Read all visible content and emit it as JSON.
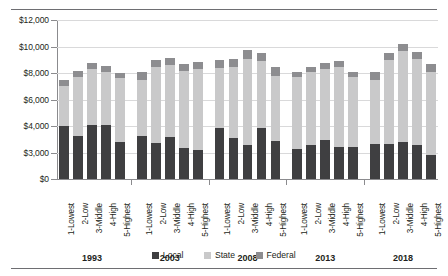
{
  "chart_data": {
    "type": "bar",
    "subtype": "stacked-bar-grouped",
    "title": "",
    "xlabel": "",
    "ylabel": "",
    "grid": true,
    "legend_position": "bottom-center",
    "y_axis": {
      "tick_labels": [
        "$0",
        "$3,000",
        "$4,000",
        "$6,000",
        "$8,000",
        "$10,000",
        "$12,000"
      ],
      "tick_values": [
        0,
        3000,
        4000,
        6000,
        8000,
        10000,
        12000
      ],
      "broken_axis": true,
      "note": "ticks evenly spaced in pixels despite unequal value steps",
      "ylim": [
        0,
        12000
      ]
    },
    "groups": [
      "1993",
      "2003",
      "2008",
      "2013",
      "2018"
    ],
    "categories": [
      "1-Lowest",
      "2-Low",
      "3-Middle",
      "4-High",
      "5-Highest"
    ],
    "series": [
      {
        "name": "Local",
        "color": "#3f3f41",
        "values": [
          [
            4000,
            3620,
            4050,
            4040,
            3400
          ],
          [
            3620,
            3370,
            3570,
            3170,
            3110
          ],
          [
            3940,
            3550,
            3290,
            3920,
            3420
          ],
          [
            3120,
            3290,
            3460,
            3220,
            3220
          ],
          [
            3310,
            3310,
            3380,
            3290,
            2700
          ]
        ]
      },
      {
        "name": "State",
        "color": "#c9c9ca",
        "values": [
          [
            3020,
            4070,
            4250,
            4060,
            4200
          ],
          [
            3870,
            5060,
            5030,
            4960,
            5180
          ],
          [
            4470,
            4900,
            5790,
            4960,
            4380
          ],
          [
            4600,
            4760,
            4860,
            5230,
            4480
          ],
          [
            4180,
            5670,
            6250,
            5760,
            5400
          ]
        ]
      },
      {
        "name": "Federal",
        "color": "#8d8d90",
        "values": [
          [
            480,
            440,
            460,
            440,
            430
          ],
          [
            580,
            520,
            530,
            560,
            540
          ],
          [
            610,
            640,
            660,
            640,
            620
          ],
          [
            370,
            400,
            430,
            420,
            400
          ],
          [
            580,
            540,
            570,
            560,
            550
          ]
        ]
      }
    ],
    "totals": [
      [
        7500,
        8130,
        8760,
        8540,
        8030
      ],
      [
        8070,
        8950,
        9130,
        8690,
        8830
      ],
      [
        9020,
        9090,
        9740,
        9520,
        8420
      ],
      [
        8090,
        8450,
        8750,
        8870,
        8100
      ],
      [
        8070,
        9520,
        10200,
        9610,
        8650
      ]
    ]
  },
  "legend": {
    "items": [
      {
        "label": "Local",
        "color": "#3f3f41"
      },
      {
        "label": "State",
        "color": "#c9c9ca"
      },
      {
        "label": "Federal",
        "color": "#8d8d90"
      }
    ]
  }
}
